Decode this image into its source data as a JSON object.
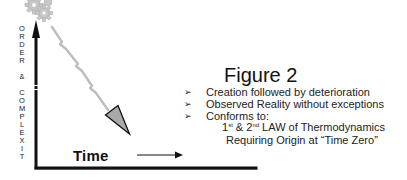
{
  "figure": {
    "title": "Figure 2",
    "y_axis_label_letters": [
      "O",
      "R",
      "D",
      "E",
      "R",
      "",
      "&",
      "",
      "C",
      "O",
      "M",
      "P",
      "L",
      "E",
      "X",
      "I",
      "T"
    ],
    "x_axis_label": "Time",
    "bullets": [
      "Creation followed by deterioration",
      "Observed Reality without exceptions",
      "Conforms to:"
    ],
    "sub_lines": {
      "line1_a": "1",
      "line1_sup_a": "st",
      "line1_b": " & 2",
      "line1_sup_b": "nd",
      "line1_c": " LAW of Thermodynamics",
      "line2": "Requiring Origin at “Time Zero”"
    },
    "bullet_mark": "➢",
    "colors": {
      "axis": "#111111",
      "bolt": "#bdbdbd",
      "arrowhead_fill": "#a9a9a9",
      "gears": "#c8c8c8"
    }
  }
}
